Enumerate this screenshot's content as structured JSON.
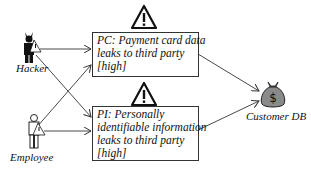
{
  "actors": [
    {
      "id": "hacker",
      "label": "Hacker",
      "icon": "hacker-icon"
    },
    {
      "id": "employee",
      "label": "Employee",
      "icon": "employee-icon"
    }
  ],
  "threats": [
    {
      "id": "PC",
      "lines": [
        "PC: Payment card data",
        "leaks to third party",
        "[high]"
      ],
      "icon": "warning-icon"
    },
    {
      "id": "PI",
      "lines": [
        "PI: Personally",
        "identifiable information",
        "leaks to third party",
        "[high]"
      ],
      "icon": "warning-icon"
    }
  ],
  "asset": {
    "label": "Customer DB",
    "icon": "money-bag-icon",
    "symbol": "$"
  },
  "edges": [
    {
      "from": "hacker",
      "to": "PC"
    },
    {
      "from": "hacker",
      "to": "PI"
    },
    {
      "from": "employee",
      "to": "PC"
    },
    {
      "from": "employee",
      "to": "PI"
    },
    {
      "from": "PC",
      "to": "asset"
    },
    {
      "from": "PI",
      "to": "asset"
    }
  ],
  "colors": {
    "line": "#333333",
    "bag": "#8a8a8a",
    "figure": "#111111"
  }
}
